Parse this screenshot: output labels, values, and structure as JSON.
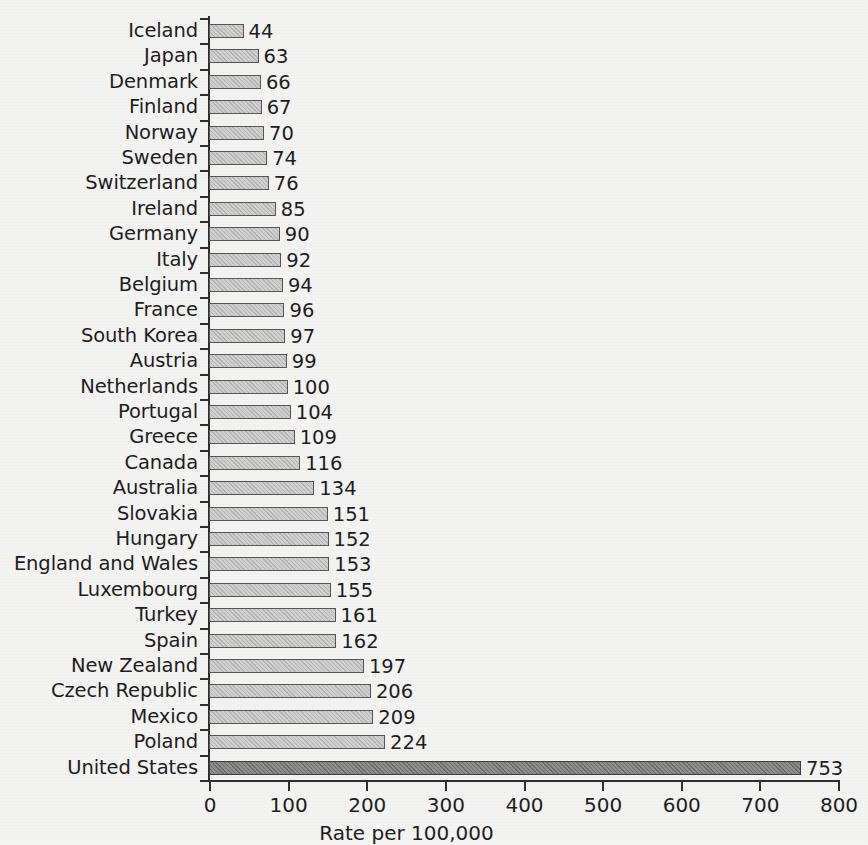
{
  "chart_data": {
    "type": "bar",
    "orientation": "horizontal",
    "title": "",
    "xlabel": "Rate per 100,000",
    "ylabel": "",
    "xlim": [
      0,
      800
    ],
    "xticks": [
      0,
      100,
      200,
      300,
      400,
      500,
      600,
      700,
      800
    ],
    "grid": false,
    "legend": null,
    "highlight_category": "United States",
    "colors": {
      "background": "#f3f3f2",
      "bar_fill": "#cfcfcf",
      "bar_edge": "#555555",
      "highlight_fill": "#8d8d8d",
      "highlight_edge": "#3b3b3b",
      "axis": "#2e2e2e",
      "text": "#1d1d1d"
    },
    "categories": [
      "Iceland",
      "Japan",
      "Denmark",
      "Finland",
      "Norway",
      "Sweden",
      "Switzerland",
      "Ireland",
      "Germany",
      "Italy",
      "Belgium",
      "France",
      "South Korea",
      "Austria",
      "Netherlands",
      "Portugal",
      "Greece",
      "Canada",
      "Australia",
      "Slovakia",
      "Hungary",
      "England and Wales",
      "Luxembourg",
      "Turkey",
      "Spain",
      "New Zealand",
      "Czech Republic",
      "Mexico",
      "Poland",
      "United States"
    ],
    "values": [
      44,
      63,
      66,
      67,
      70,
      74,
      76,
      85,
      90,
      92,
      94,
      96,
      97,
      99,
      100,
      104,
      109,
      116,
      134,
      151,
      152,
      153,
      155,
      161,
      162,
      197,
      206,
      209,
      224,
      753
    ],
    "data_labels": [
      "44",
      "63",
      "66",
      "67",
      "70",
      "74",
      "76",
      "85",
      "90",
      "92",
      "94",
      "96",
      "97",
      "99",
      "100",
      "104",
      "109",
      "116",
      "134",
      "151",
      "152",
      "153",
      "155",
      "161",
      "162",
      "197",
      "206",
      "209",
      "224",
      "753"
    ],
    "xtick_labels": [
      "0",
      "100",
      "200",
      "300",
      "400",
      "500",
      "600",
      "700",
      "800"
    ]
  }
}
